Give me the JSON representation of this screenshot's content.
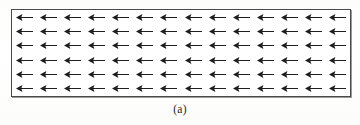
{
  "figure": {
    "caption": "(a)",
    "label": "(a)",
    "border_color": "#4a4a4a",
    "arrow_color": "#1d1d1d",
    "background_color": "#ffffff",
    "page_background": "#fefefe"
  },
  "chart_data": {
    "type": "quiver",
    "title": "(a)",
    "xlabel": "",
    "ylabel": "",
    "columns": 14,
    "rows": 6,
    "arrow_direction": "left",
    "arrow_angle_deg": 180,
    "uniform_magnitude": true,
    "magnitude": 1,
    "legend": [],
    "grid": false,
    "axis_visible": false,
    "annotations": [
      "(a)"
    ],
    "vectors": [
      {
        "row": 0,
        "values": [
          180,
          180,
          180,
          180,
          180,
          180,
          180,
          180,
          180,
          180,
          180,
          180,
          180,
          180
        ]
      },
      {
        "row": 1,
        "values": [
          180,
          180,
          180,
          180,
          180,
          180,
          180,
          180,
          180,
          180,
          180,
          180,
          180,
          180
        ]
      },
      {
        "row": 2,
        "values": [
          180,
          180,
          180,
          180,
          180,
          180,
          180,
          180,
          180,
          180,
          180,
          180,
          180,
          180
        ]
      },
      {
        "row": 3,
        "values": [
          180,
          180,
          180,
          180,
          180,
          180,
          180,
          180,
          180,
          180,
          180,
          180,
          180,
          180
        ]
      },
      {
        "row": 4,
        "values": [
          180,
          180,
          180,
          180,
          180,
          180,
          180,
          180,
          180,
          180,
          180,
          180,
          180,
          180
        ]
      },
      {
        "row": 5,
        "values": [
          180,
          180,
          180,
          180,
          180,
          180,
          180,
          180,
          180,
          180,
          180,
          180,
          180,
          180
        ]
      }
    ]
  }
}
